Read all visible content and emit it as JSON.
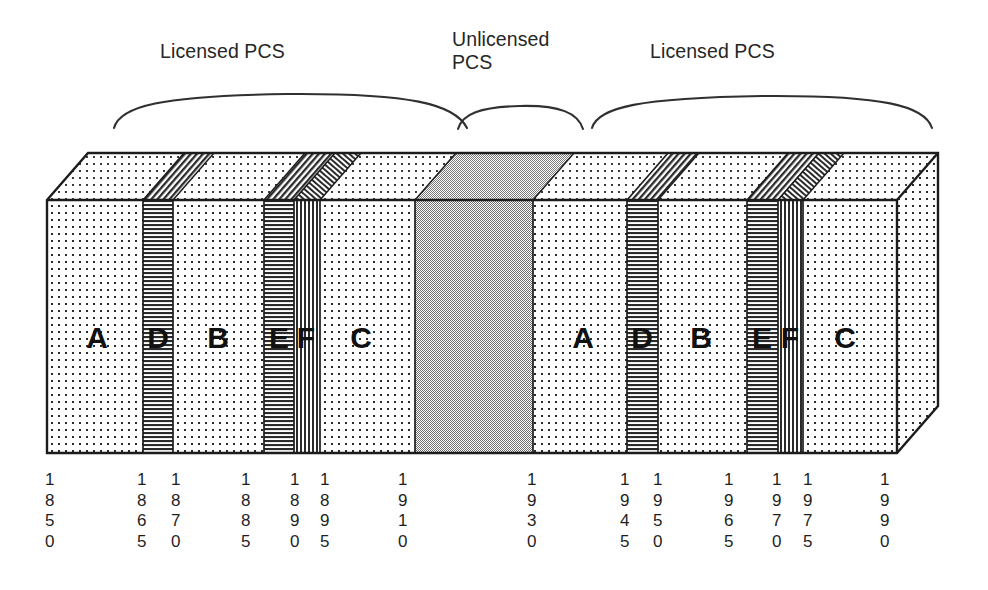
{
  "figure": {
    "title_labels": [
      {
        "id": "licensed-left",
        "text": "Licensed PCS",
        "x": 160,
        "y": 40
      },
      {
        "id": "unlicensed",
        "text": "Unlicensed\nPCS",
        "x": 452,
        "y": 28
      },
      {
        "id": "licensed-right",
        "text": "Licensed PCS",
        "x": 650,
        "y": 40
      }
    ],
    "bands": [
      {
        "label": "A",
        "fill": "dots",
        "group": "licensed-left",
        "x0": 47,
        "x1": 143
      },
      {
        "label": "D",
        "fill": "hlines",
        "group": "licensed-left",
        "x0": 143,
        "x1": 173
      },
      {
        "label": "B",
        "fill": "dots",
        "group": "licensed-left",
        "x0": 173,
        "x1": 264
      },
      {
        "label": "E",
        "fill": "hlines",
        "group": "licensed-left",
        "x0": 264,
        "x1": 294
      },
      {
        "label": "F",
        "fill": "vlines",
        "group": "licensed-left",
        "x0": 294,
        "x1": 320
      },
      {
        "label": "C",
        "fill": "dots",
        "group": "licensed-left",
        "x0": 320,
        "x1": 415
      },
      {
        "label": "",
        "fill": "gray",
        "group": "unlicensed",
        "x0": 415,
        "x1": 533
      },
      {
        "label": "A",
        "fill": "dots",
        "group": "licensed-right",
        "x0": 533,
        "x1": 627
      },
      {
        "label": "D",
        "fill": "hlines",
        "group": "licensed-right",
        "x0": 627,
        "x1": 658
      },
      {
        "label": "B",
        "fill": "dots",
        "group": "licensed-right",
        "x0": 658,
        "x1": 747
      },
      {
        "label": "E",
        "fill": "hlines",
        "group": "licensed-right",
        "x0": 747,
        "x1": 778
      },
      {
        "label": "F",
        "fill": "vlines",
        "group": "licensed-right",
        "x0": 778,
        "x1": 803
      },
      {
        "label": "C",
        "fill": "dots",
        "group": "licensed-right",
        "x0": 803,
        "x1": 897
      }
    ],
    "frequency_ticks": [
      {
        "value": "1850",
        "digits": "1\n8\n5\n0",
        "x": 45
      },
      {
        "value": "1865",
        "digits": "1\n8\n6\n5",
        "x": 137
      },
      {
        "value": "1870",
        "digits": "1\n8\n7\n0",
        "x": 171
      },
      {
        "value": "1885",
        "digits": "1\n8\n8\n5",
        "x": 241
      },
      {
        "value": "1890",
        "digits": "1\n8\n9\n0",
        "x": 290
      },
      {
        "value": "1895",
        "digits": "1\n8\n9\n5",
        "x": 320
      },
      {
        "value": "1910",
        "digits": "1\n9\n1\n0",
        "x": 398
      },
      {
        "value": "1930",
        "digits": "1\n9\n3\n0",
        "x": 527
      },
      {
        "value": "1945",
        "digits": "1\n9\n4\n5",
        "x": 620
      },
      {
        "value": "1950",
        "digits": "1\n9\n5\n0",
        "x": 653
      },
      {
        "value": "1965",
        "digits": "1\n9\n6\n5",
        "x": 724
      },
      {
        "value": "1970",
        "digits": "1\n9\n7\n0",
        "x": 772
      },
      {
        "value": "1975",
        "digits": "1\n9\n7\n5",
        "x": 803
      },
      {
        "value": "1990",
        "digits": "1\n9\n9\n0",
        "x": 880
      }
    ],
    "colors": {
      "outline": "#1c1c1c",
      "unlicensed_fill": "#b3b3b3",
      "background": "#ffffff",
      "text": "#262626"
    },
    "geometry": {
      "front_left": 47,
      "front_right": 897,
      "front_top": 200,
      "front_bottom": 453,
      "depth_dx": 41,
      "depth_dy": -47
    }
  }
}
